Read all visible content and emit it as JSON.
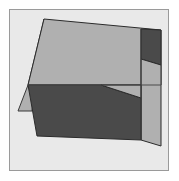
{
  "figure": {
    "canvas": {
      "width": 179,
      "height": 181,
      "background_color": "#ffffff"
    },
    "frame": {
      "x": 9,
      "y": 9,
      "width": 160,
      "height": 162,
      "border_color": "#9a9a9a",
      "border_width": 1,
      "fill_color": "#e9e9e9"
    },
    "palette": {
      "light_face": "#b0b0b0",
      "dark_face": "#4a4a4a",
      "outline": "#2b2b2b",
      "background": "#e9e9e9",
      "page": "#ffffff"
    },
    "shapes": [
      {
        "name": "left-light-tail",
        "role": "light-face",
        "fill": "#b0b0b0",
        "stroke": "#3a3a3a",
        "points": "44,19 28,85 18,111 32,111"
      },
      {
        "name": "upper-light-face",
        "role": "light-face",
        "fill": "#b0b0b0",
        "stroke": "#2b2b2b",
        "points": "44,19 161,30 161,85 28,85"
      },
      {
        "name": "right-dark-panel",
        "role": "dark-face",
        "fill": "#4a4a4a",
        "stroke": "#2b2b2b",
        "points": "141,29 161,30 161,65 141,59"
      },
      {
        "name": "right-light-strip",
        "role": "light-face",
        "fill": "#b0b0b0",
        "stroke": "#2b2b2b",
        "points": "141,59 161,65 161,146 141,140"
      },
      {
        "name": "lower-dark-face",
        "role": "dark-face",
        "fill": "#4a4a4a",
        "stroke": "#2b2b2b",
        "points": "28,85 101,85 141,98 141,140 37,136"
      },
      {
        "name": "lower-right-light-wedge",
        "role": "light-face",
        "fill": "#b0b0b0",
        "stroke": "#2b2b2b",
        "points": "101,85 141,85 141,98"
      }
    ],
    "edges": [
      {
        "name": "mid-horizontal-edge",
        "from": "28,85",
        "to": "161,85",
        "stroke": "#4a4a4a"
      },
      {
        "name": "right-vertical-edge",
        "from": "141,29",
        "to": "141,140",
        "stroke": "#3a3a3a"
      }
    ]
  }
}
